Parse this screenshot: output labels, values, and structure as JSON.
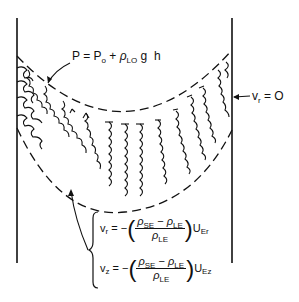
{
  "figure": {
    "top_label": {
      "P": "P",
      "eq": "=",
      "P0": "P",
      "P0_sub": "o",
      "plus": "+",
      "rho": "ρ",
      "rho_sub": "LO",
      "g": "g",
      "h": "h"
    },
    "wall_label": {
      "v": "v",
      "sub": "r",
      "rest": "= O"
    },
    "equations": [
      {
        "lhs": "v",
        "lhs_sub": "r",
        "eq": "= −",
        "num_rho1": "ρ",
        "num_sub1": "SE",
        "minus": "−",
        "num_rho2": "ρ",
        "num_sub2": "LE",
        "den_rho": "ρ",
        "den_sub": "LE",
        "U": "U",
        "U_sub": "Er"
      },
      {
        "lhs": "v",
        "lhs_sub": "z",
        "eq": "= −",
        "num_rho1": "ρ",
        "num_sub1": "SE",
        "minus": "−",
        "num_rho2": "ρ",
        "num_sub2": "LE",
        "den_rho": "ρ",
        "den_sub": "LE",
        "U": "U",
        "U_sub": "Ez"
      }
    ],
    "colors": {
      "ink": "#111111",
      "background": "#ffffff"
    }
  }
}
